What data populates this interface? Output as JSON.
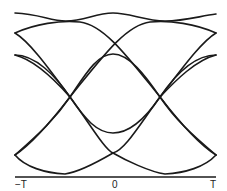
{
  "diagram": {
    "type": "eye-diagram",
    "stroke_color": "#1a1a1a",
    "axis": {
      "tick_labels": [
        "−T",
        "0",
        "T"
      ]
    }
  }
}
